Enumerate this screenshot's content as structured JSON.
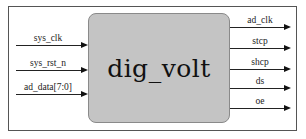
{
  "diagram": {
    "module": {
      "name": "dig_volt",
      "fill": "#c4c4c4"
    },
    "inputs": [
      {
        "label": "sys_clk",
        "y": 45
      },
      {
        "label": "sys_rst_n",
        "y": 70
      },
      {
        "label": "ad_data[7:0]",
        "y": 94
      }
    ],
    "outputs": [
      {
        "label": "ad_clk",
        "y": 27
      },
      {
        "label": "stcp",
        "y": 48
      },
      {
        "label": "shcp",
        "y": 69
      },
      {
        "label": "ds",
        "y": 88
      },
      {
        "label": "oe",
        "y": 108
      }
    ]
  }
}
